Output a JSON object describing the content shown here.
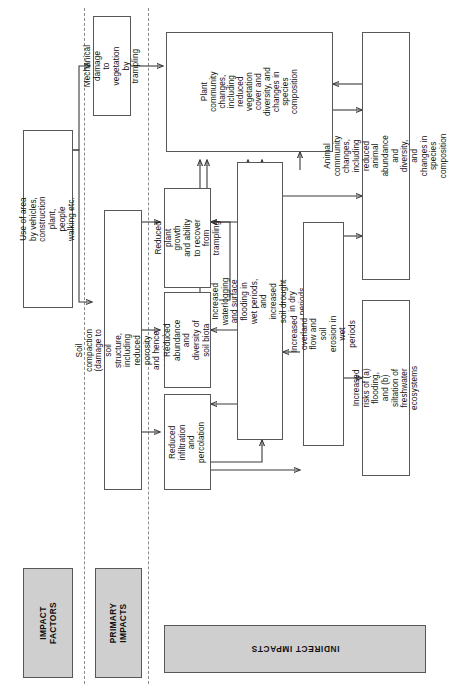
{
  "diagram": {
    "orientation": "rotated-90",
    "bands": [
      {
        "id": "impact-factors",
        "label": "IMPACT\nFACTORS"
      },
      {
        "id": "primary-impacts",
        "label": "PRIMARY\nIMPACTS"
      },
      {
        "id": "indirect-impacts",
        "label": "INDIRECT IMPACTS"
      }
    ],
    "nodes": [
      {
        "id": "use-of-area",
        "label": "Use of area by vehicles,\nconstruction plant,\npeople walking etc."
      },
      {
        "id": "mechanical-damage",
        "label": "Mechanical damage\nto vegetation\nby trampling"
      },
      {
        "id": "soil-compaction",
        "label": "Soil compaction (damage to soil structure,\nincluding reduced porosity and hence aeration)"
      },
      {
        "id": "reduced-plant-growth",
        "label": "Reduced plant growth\nand ability to recover\nfrom trampling"
      },
      {
        "id": "reduced-soil-biota",
        "label": "Reduced abundance\nand diversity of\nsoil biota"
      },
      {
        "id": "reduced-infiltration",
        "label": "Reduced infiltration\nand percolation"
      },
      {
        "id": "waterlogging",
        "label": "Increased waterlogging and surface flooding in wet periods,\nand increased soil drought in dry periods"
      },
      {
        "id": "overland-flow",
        "label": "Increased overland flow and soil\nerosion in wet periods"
      },
      {
        "id": "plant-community",
        "label": "Plant\ncommunity\nchanges,\nincluding\nreduced\nvegetation\ncover and\ndiversity, and\nchanges in\nspecies\ncomposition"
      },
      {
        "id": "animal-community",
        "label": "Animal community changes, including reduced\nanimal abundance and diversity, and\nchanges in species composition"
      },
      {
        "id": "flood-siltation",
        "label": "Increased risks of (a) flooding,\nand (b) siltation of\nfreshwater ecosystems"
      }
    ],
    "colors": {
      "band_fill": "#cfcfcf",
      "box_border": "#58585a",
      "wire": "#3a3a3c",
      "divider": "#8b8b8d"
    }
  }
}
